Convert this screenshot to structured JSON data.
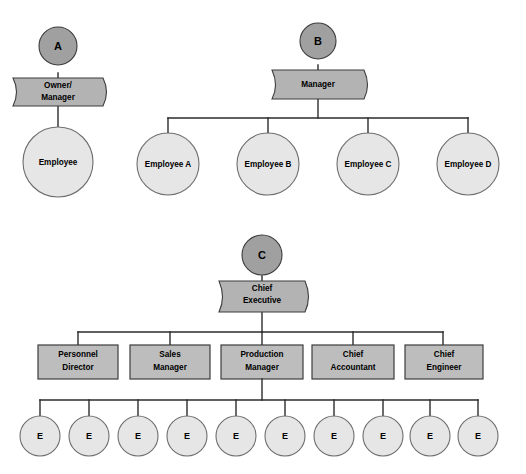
{
  "diagram": {
    "background_color": "#ffffff",
    "line_color": "#2b2b2b",
    "colors": {
      "badge_fill": "#a0a0a0",
      "banner_fill": "#b3b3b3",
      "box_fill": "#bdbdbd",
      "circle_fill": "#e6e6e6",
      "stroke_dark": "#3c3c3c",
      "stroke_light": "#6e6e6e",
      "text": "#000000"
    },
    "sections": [
      {
        "id": "A",
        "badge_label": "A",
        "top": {
          "label": "Owner/\nManager",
          "line1": "Owner/",
          "line2": "Manager",
          "shape": "rounded-banner"
        },
        "children": [
          {
            "label": "Employee",
            "shape": "circle"
          }
        ]
      },
      {
        "id": "B",
        "badge_label": "B",
        "top": {
          "label": "Manager",
          "line1": "Manager",
          "line2": "",
          "shape": "rounded-banner"
        },
        "children": [
          {
            "label": "Employee A",
            "shape": "circle"
          },
          {
            "label": "Employee B",
            "shape": "circle"
          },
          {
            "label": "Employee C",
            "shape": "circle"
          },
          {
            "label": "Employee D",
            "shape": "circle"
          }
        ]
      },
      {
        "id": "C",
        "badge_label": "C",
        "top": {
          "label": "Chief Executive",
          "line1": "Chief",
          "line2": "Executive",
          "shape": "rounded-banner"
        },
        "managers": [
          {
            "line1": "Personnel",
            "line2": "Director",
            "shape": "rect"
          },
          {
            "line1": "Sales",
            "line2": "Manager",
            "shape": "rect"
          },
          {
            "line1": "Production",
            "line2": "Manager",
            "shape": "rect"
          },
          {
            "line1": "Chief",
            "line2": "Accountant",
            "shape": "rect"
          },
          {
            "line1": "Chief",
            "line2": "Engineer",
            "shape": "rect"
          }
        ],
        "employees": [
          {
            "label": "E"
          },
          {
            "label": "E"
          },
          {
            "label": "E"
          },
          {
            "label": "E"
          },
          {
            "label": "E"
          },
          {
            "label": "E"
          },
          {
            "label": "E"
          },
          {
            "label": "E"
          },
          {
            "label": "E"
          },
          {
            "label": "E"
          }
        ]
      }
    ]
  }
}
